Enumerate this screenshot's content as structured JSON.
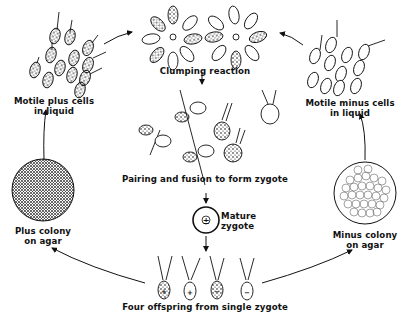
{
  "diagram": {
    "type": "life-cycle",
    "labels": {
      "motile_plus": [
        "Motile plus cells",
        "in liquid"
      ],
      "clumping": "Clumping reaction",
      "motile_minus": [
        "Motile minus cells",
        "in liquid"
      ],
      "pairing": "Pairing and fusion to form zygote",
      "mature_zygote": [
        "Mature",
        "zygote"
      ],
      "plus_colony": [
        "Plus colony",
        "on agar"
      ],
      "minus_colony": [
        "Minus colony",
        "on agar"
      ],
      "offspring": "Four offspring from single zygote"
    },
    "zygote_symbol": "±",
    "offspring_signs": [
      "+",
      "+",
      "−",
      "−"
    ],
    "colors": {
      "ink": "#111111",
      "background": "#ffffff"
    },
    "stages": [
      "Motile plus cells in liquid",
      "Clumping reaction",
      "Pairing and fusion to form zygote",
      "Mature zygote",
      "Four offspring from single zygote",
      "Plus colony on agar",
      "Minus colony on agar",
      "Motile minus cells in liquid"
    ]
  }
}
